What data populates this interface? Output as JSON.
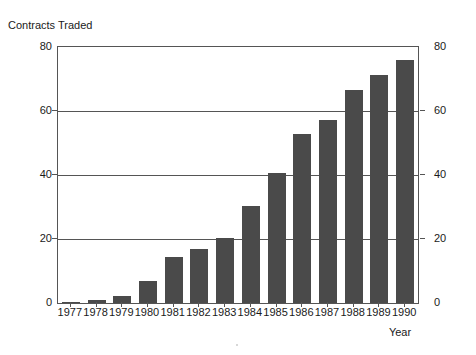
{
  "chart_data": {
    "type": "bar",
    "title": "Contracts Traded",
    "xlabel": "Year",
    "ylabel": "",
    "categories": [
      "1977",
      "1978",
      "1979",
      "1980",
      "1981",
      "1982",
      "1983",
      "1984",
      "1985",
      "1986",
      "1987",
      "1988",
      "1989",
      "1990"
    ],
    "values": [
      0.3,
      1.0,
      2.2,
      6.8,
      14.3,
      17.0,
      20.3,
      30.2,
      40.6,
      52.8,
      57.3,
      66.6,
      71.2,
      76.0
    ],
    "ylim": [
      0,
      80
    ],
    "yticks": [
      0,
      20,
      40,
      60,
      80
    ],
    "ytick_labels_left": [
      "0",
      "20",
      "40",
      "60",
      "80"
    ],
    "ytick_labels_right": [
      "0",
      "20",
      "40",
      "60",
      "80"
    ],
    "grid": true,
    "grid_axis": "y",
    "legend": "none",
    "bar_color": "#4a4a4a",
    "axis_color": "#555555",
    "background": "#ffffff",
    "dual_y_axis": true
  }
}
